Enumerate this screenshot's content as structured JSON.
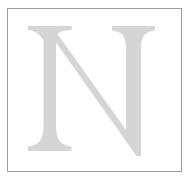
{
  "canvas": {
    "width": 191,
    "height": 185,
    "background_color": "#ffffff"
  },
  "frame": {
    "name": "bordered-box",
    "border_color": "#9d9d9d",
    "border_width_px": 1,
    "fill_color": "#ffffff",
    "left": 7,
    "top": 8,
    "width": 175,
    "height": 164
  },
  "glyph": {
    "character": "N",
    "description": "large serif capital letter N",
    "color": "#d5d5d5",
    "style": "serif",
    "weight": "regular",
    "alt_text": "N"
  }
}
